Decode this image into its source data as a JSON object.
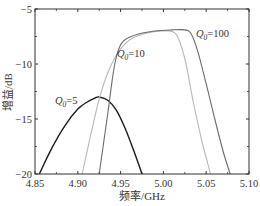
{
  "chart_data": {
    "type": "line",
    "title": "",
    "xlabel": "频率/GHz",
    "ylabel": "增益/dB",
    "xlim": [
      4.85,
      5.1
    ],
    "ylim": [
      -20,
      -5
    ],
    "xticks": [
      "4.85",
      "4.90",
      "4.95",
      "5.00",
      "5.05",
      "5.10"
    ],
    "yticks": [
      "-5",
      "-10",
      "-15",
      "-20"
    ],
    "grid": false,
    "legend": "inline labels",
    "series": [
      {
        "name": "Q0=5",
        "label_main": "Q",
        "label_sub": "0",
        "label_rest": "=5",
        "color": "#1a1a1a",
        "x": [
          4.855,
          4.87,
          4.885,
          4.9,
          4.91,
          4.92,
          4.925,
          4.935,
          4.945,
          4.955,
          4.965,
          4.975
        ],
        "y": [
          -20,
          -17.6,
          -15.6,
          -14.1,
          -13.5,
          -13.1,
          -13.0,
          -13.3,
          -14.2,
          -15.8,
          -17.8,
          -20
        ]
      },
      {
        "name": "Q0=10",
        "label_main": "Q",
        "label_sub": "0",
        "label_rest": "=10",
        "color": "#b8b8b8",
        "x": [
          4.905,
          4.915,
          4.925,
          4.935,
          4.945,
          4.955,
          4.965,
          4.98,
          5.0,
          5.015,
          5.025,
          5.035,
          5.045,
          5.055
        ],
        "y": [
          -20,
          -16.5,
          -13.2,
          -10.8,
          -9.2,
          -8.2,
          -7.6,
          -7.2,
          -7.0,
          -7.3,
          -9.5,
          -13.5,
          -17.0,
          -20
        ]
      },
      {
        "name": "Q0=100",
        "label_main": "Q",
        "label_sub": "0",
        "label_rest": "=100",
        "color": "#6a6a6a",
        "x": [
          4.925,
          4.935,
          4.942,
          4.948,
          4.955,
          4.97,
          4.99,
          5.01,
          5.025,
          5.032,
          5.04,
          5.05,
          5.06,
          5.07,
          5.078
        ],
        "y": [
          -20,
          -14.5,
          -10.5,
          -8.6,
          -7.8,
          -7.3,
          -7.0,
          -6.9,
          -6.9,
          -7.2,
          -8.8,
          -11.8,
          -15.0,
          -18.0,
          -20
        ]
      }
    ]
  }
}
